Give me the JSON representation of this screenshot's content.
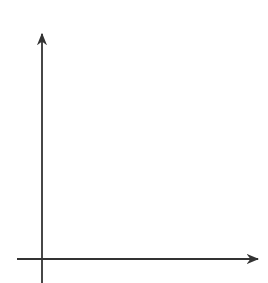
{
  "bullet": "•",
  "chart_data": {
    "type": "line",
    "title": "",
    "function": "y = |x - 2|",
    "xlabel": "x",
    "ylabel": "y",
    "xlim": [
      -0.5,
      4.5
    ],
    "ylim": [
      -0.5,
      5.0
    ],
    "x_ticks": [
      1,
      2,
      3,
      4
    ],
    "y_ticks": [
      1,
      2,
      3,
      4
    ],
    "grid": true,
    "grid_step": 0.5,
    "series": [
      {
        "name": "left-ray",
        "points": [
          [
            2,
            0
          ],
          [
            -0.5,
            2.5
          ]
        ],
        "arrow": "end"
      },
      {
        "name": "right-ray",
        "points": [
          [
            2,
            0
          ],
          [
            4.5,
            2.5
          ]
        ],
        "arrow": "end"
      }
    ],
    "line_color": "#6b6b6b"
  }
}
